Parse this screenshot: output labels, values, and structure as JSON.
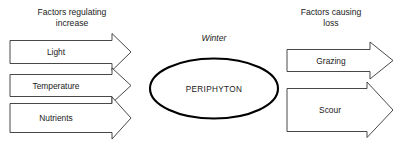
{
  "diagram": {
    "title_left": "Factors regulating increase",
    "title_right": "Factors causing loss",
    "center_node": "PERIPHYTON",
    "season": "Winter",
    "headers": {
      "left_line1": "Factors regulating",
      "left_line2": "increase",
      "right_line1": "Factors causing",
      "right_line2": "loss"
    },
    "inputs": [
      {
        "label": "Light"
      },
      {
        "label": "Temperature"
      },
      {
        "label": "Nutrients"
      }
    ],
    "outputs": [
      {
        "label": "Grazing"
      },
      {
        "label": "Scour"
      }
    ],
    "colors": {
      "background": "#ffffff",
      "text": "#1a1a1a",
      "arrow_stroke": "#333333",
      "ellipse_stroke": "#000000"
    }
  }
}
